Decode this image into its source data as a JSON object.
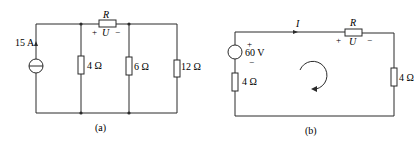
{
  "circuit_a": {
    "caption": "(a)",
    "current_source": {
      "value": "15 A"
    },
    "series_resistor": {
      "name": "R",
      "voltage_label": "U",
      "plus": "+",
      "minus": "−"
    },
    "resistors": [
      {
        "label": "4 Ω"
      },
      {
        "label": "6 Ω"
      },
      {
        "label": "12 Ω"
      }
    ]
  },
  "circuit_b": {
    "caption": "(b)",
    "voltage_source": {
      "value": "60 V",
      "plus": "+",
      "minus": "−"
    },
    "source_resistor": {
      "label": "4 Ω"
    },
    "current_label": "I",
    "series_resistor": {
      "name": "R",
      "voltage_label": "U",
      "plus": "+",
      "minus": "−"
    },
    "load_resistor": {
      "label": "4 Ω"
    }
  },
  "colors": {
    "ink": "#2a2a2a",
    "background": "#ffffff"
  }
}
